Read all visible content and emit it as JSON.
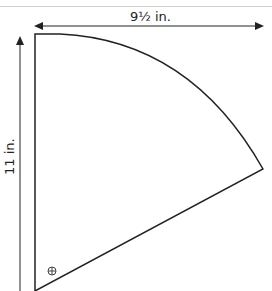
{
  "diagram": {
    "type": "pattern-piece",
    "shape": "quarter-circle-wedge",
    "width_label": "9½ in.",
    "height_label": "11 in.",
    "marker_icon": "crosshair-circle-icon",
    "colors": {
      "line": "#222222",
      "guide": "#d0d0d0",
      "background": "#ffffff"
    }
  }
}
